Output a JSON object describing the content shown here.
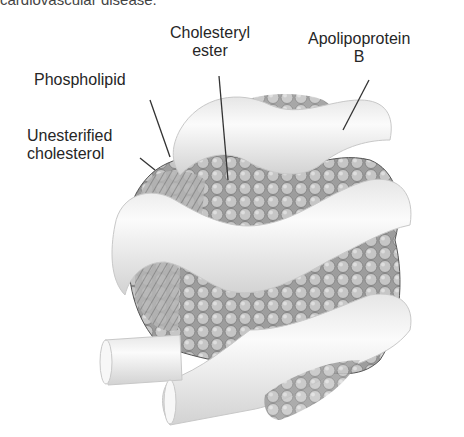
{
  "caption_fragment": "cardiovascular disease.",
  "labels": {
    "cholesteryl_ester": [
      "Cholesteryl",
      "ester"
    ],
    "apolipoprotein_b": [
      "Apolipoprotein",
      "B"
    ],
    "phospholipid": "Phospholipid",
    "unesterified_cholesterol": [
      "Unesterified",
      "cholesterol"
    ]
  },
  "colors": {
    "band": "#f2f2f2",
    "band_shade": "#d4d4d4",
    "core": "#a9a9a9",
    "core_dark": "#6e6e6e",
    "sphere": "#c4c4c4",
    "line": "#333333"
  }
}
